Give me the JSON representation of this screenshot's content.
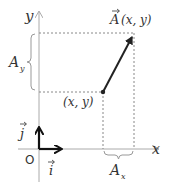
{
  "diagram": {
    "type": "vector-components",
    "axes": {
      "x_label": "x",
      "y_label": "y",
      "origin_label": "O"
    },
    "unit_vectors": {
      "i_label": "i",
      "j_label": "j"
    },
    "vector": {
      "name_label": "A",
      "tip_coords_label": "(x, y)",
      "tail_coords_label": "(x, y)"
    },
    "components": {
      "x_component_label": "A",
      "x_component_subscript": "x",
      "y_component_label": "A",
      "y_component_subscript": "y"
    },
    "colors": {
      "axis": "#aaaaaa",
      "dashed": "#888888",
      "vector": "#222222",
      "unit_vector": "#111111",
      "text": "#333333"
    }
  }
}
